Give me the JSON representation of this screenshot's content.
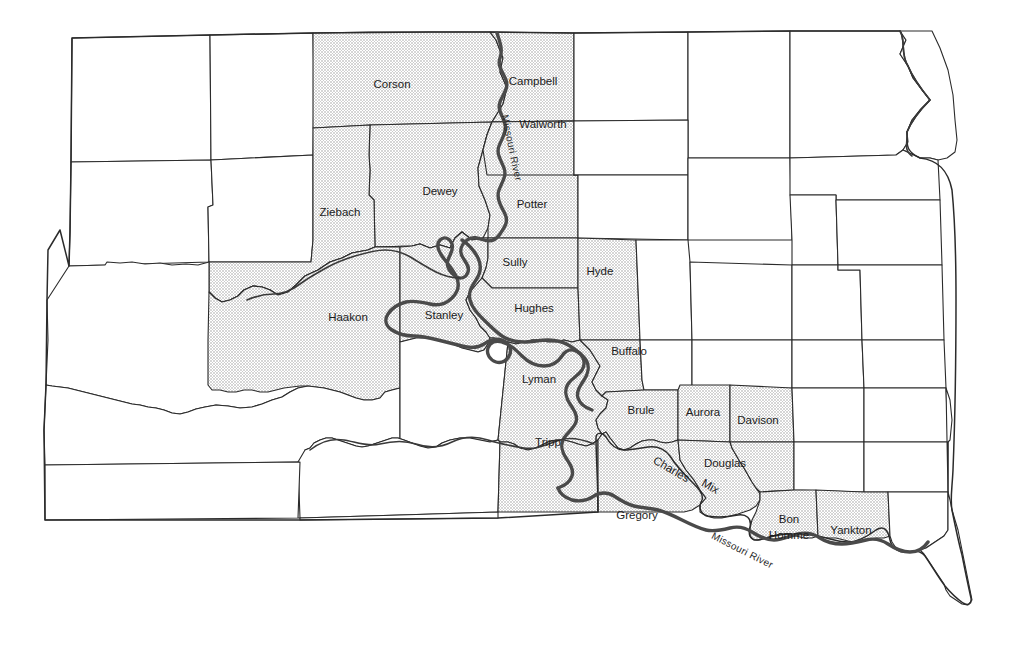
{
  "map": {
    "title": "South Dakota counties bordering the Missouri River",
    "state": "South Dakota",
    "background_color": "#ffffff",
    "shaded_fill_color": "#dedede",
    "boundary_color": "#2b2b2b",
    "river_color": "#4a4a4a",
    "legend_note": "Shaded counties border the Missouri River"
  },
  "rivers": [
    {
      "id": "missouri-north",
      "label": "Missouri River",
      "label_x": 511,
      "label_y": 148,
      "rotation": 78
    },
    {
      "id": "missouri-south",
      "label": "Missouri River",
      "label_x": 742,
      "label_y": 551,
      "rotation": 27
    }
  ],
  "counties": [
    {
      "id": "corson",
      "label": "Corson",
      "shaded": true,
      "x": 392,
      "y": 85
    },
    {
      "id": "campbell",
      "label": "Campbell",
      "shaded": true,
      "x": 533,
      "y": 82
    },
    {
      "id": "walworth",
      "label": "Walworth",
      "shaded": true,
      "x": 543,
      "y": 125
    },
    {
      "id": "dewey",
      "label": "Dewey",
      "shaded": true,
      "x": 440,
      "y": 192
    },
    {
      "id": "potter",
      "label": "Potter",
      "shaded": true,
      "x": 532,
      "y": 205
    },
    {
      "id": "ziebach",
      "label": "Ziebach",
      "shaded": true,
      "x": 340,
      "y": 213
    },
    {
      "id": "sully",
      "label": "Sully",
      "shaded": true,
      "x": 515,
      "y": 263
    },
    {
      "id": "hyde",
      "label": "Hyde",
      "shaded": true,
      "x": 600,
      "y": 272
    },
    {
      "id": "hughes",
      "label": "Hughes",
      "shaded": true,
      "x": 534,
      "y": 309
    },
    {
      "id": "haakon",
      "label": "Haakon",
      "shaded": true,
      "x": 348,
      "y": 318
    },
    {
      "id": "stanley",
      "label": "Stanley",
      "shaded": true,
      "x": 444,
      "y": 316
    },
    {
      "id": "buffalo",
      "label": "Buffalo",
      "shaded": true,
      "x": 629,
      "y": 352
    },
    {
      "id": "lyman",
      "label": "Lyman",
      "shaded": true,
      "x": 539,
      "y": 380
    },
    {
      "id": "brule",
      "label": "Brule",
      "shaded": true,
      "x": 641,
      "y": 411
    },
    {
      "id": "aurora",
      "label": "Aurora",
      "shaded": true,
      "x": 703,
      "y": 413
    },
    {
      "id": "davison",
      "label": "Davison",
      "shaded": true,
      "x": 758,
      "y": 421
    },
    {
      "id": "tripp",
      "label": "Tripp",
      "shaded": true,
      "x": 548,
      "y": 443
    },
    {
      "id": "douglas",
      "label": "Douglas",
      "shaded": true,
      "x": 725,
      "y": 464
    },
    {
      "id": "charles-mix",
      "label": "Charles Mix",
      "shaded": true,
      "x": 690,
      "y": 478,
      "rotated": true
    },
    {
      "id": "gregory",
      "label": "Gregory",
      "shaded": true,
      "x": 637,
      "y": 516
    },
    {
      "id": "bon-homme",
      "label": "Bon Homme",
      "shaded": true,
      "x": 789,
      "y": 527,
      "two_line": true
    },
    {
      "id": "yankton",
      "label": "Yankton",
      "shaded": true,
      "x": 851,
      "y": 531
    }
  ],
  "charles_mix_lines": [
    "Charles",
    "Mix"
  ],
  "bon_homme_lines": [
    "Bon",
    "Homme"
  ]
}
